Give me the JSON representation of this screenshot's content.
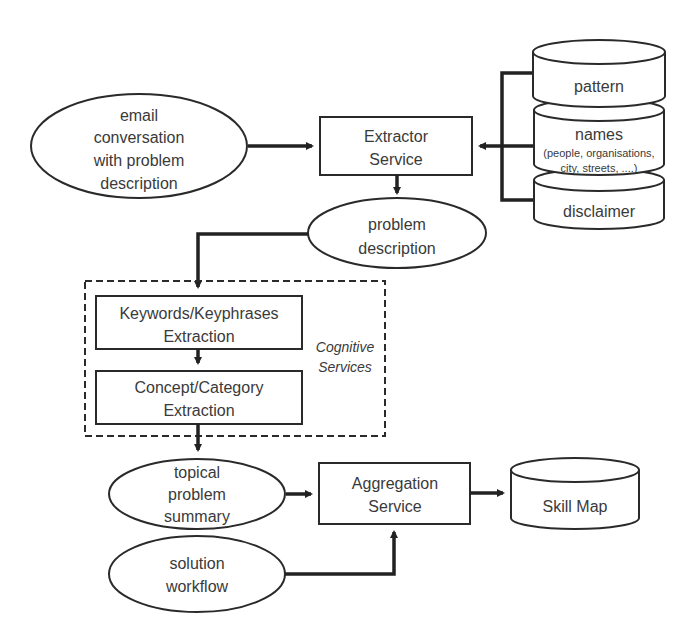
{
  "diagram": {
    "nodes": {
      "email": {
        "line1": "email",
        "line2": "conversation",
        "line3": "with problem",
        "line4": "description"
      },
      "extractor": {
        "line1": "Extractor",
        "line2": "Service"
      },
      "pattern": {
        "label": "pattern"
      },
      "names": {
        "label": "names",
        "sub1": "(people, organisations,",
        "sub2": "city, streets, ....)"
      },
      "disclaimer": {
        "label": "disclaimer"
      },
      "problem": {
        "line1": "problem",
        "line2": "description"
      },
      "keywords": {
        "line1": "Keywords/Keyphrases",
        "line2": "Extraction"
      },
      "concept": {
        "line1": "Concept/Category",
        "line2": "Extraction"
      },
      "cognitive": {
        "line1": "Cognitive",
        "line2": "Services"
      },
      "topical": {
        "line1": "topical",
        "line2": "problem",
        "line3": "summary"
      },
      "solution": {
        "line1": "solution",
        "line2": "workflow"
      },
      "aggregation": {
        "line1": "Aggregation",
        "line2": "Service"
      },
      "skillmap": {
        "label": "Skill Map"
      }
    },
    "edges": [
      {
        "from": "email",
        "to": "extractor"
      },
      {
        "from": "pattern",
        "to": "extractor"
      },
      {
        "from": "names",
        "to": "extractor"
      },
      {
        "from": "disclaimer",
        "to": "extractor"
      },
      {
        "from": "extractor",
        "to": "problem"
      },
      {
        "from": "problem",
        "to": "keywords"
      },
      {
        "from": "keywords",
        "to": "concept"
      },
      {
        "from": "concept",
        "to": "topical"
      },
      {
        "from": "topical",
        "to": "aggregation"
      },
      {
        "from": "solution",
        "to": "aggregation"
      },
      {
        "from": "aggregation",
        "to": "skillmap"
      }
    ]
  }
}
